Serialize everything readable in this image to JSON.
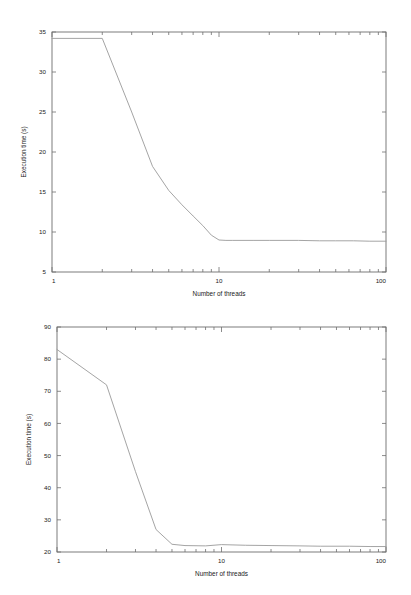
{
  "page": {
    "background_color": "#ffffff",
    "ink_color": "#1a1a1a",
    "curve_color": "#9a9a9a",
    "axis_color": "#6e6e6e"
  },
  "chart_data": [
    {
      "id": "top",
      "type": "line",
      "title": "",
      "xlabel": "Number of threads",
      "ylabel": "Execution time (s)",
      "xscale": "log",
      "yscale": "linear",
      "xlim": [
        1,
        100
      ],
      "ylim": [
        5,
        35
      ],
      "grid": false,
      "legend": null,
      "xticks": [
        1,
        10,
        100
      ],
      "xtick_labels": [
        "1",
        "10",
        "100"
      ],
      "yticks": [
        5,
        10,
        15,
        20,
        25,
        30,
        35
      ],
      "ytick_labels": [
        "5",
        "10",
        "15",
        "20",
        "25",
        "30",
        "35"
      ],
      "x": [
        1,
        2,
        3,
        4,
        5,
        6,
        7,
        8,
        9,
        10,
        11,
        12,
        16,
        20,
        30,
        40,
        50,
        64,
        80,
        100
      ],
      "y": [
        34.2,
        34.2,
        25.0,
        18.2,
        15.2,
        13.4,
        12.0,
        10.8,
        9.6,
        9.0,
        8.95,
        8.95,
        8.95,
        8.95,
        8.95,
        8.9,
        8.9,
        8.9,
        8.85,
        8.85
      ]
    },
    {
      "id": "bottom",
      "type": "line",
      "title": "",
      "xlabel": "Number of threads",
      "ylabel": "Execution time (s)",
      "xscale": "log",
      "yscale": "linear",
      "xlim": [
        1,
        100
      ],
      "ylim": [
        20,
        90
      ],
      "grid": false,
      "legend": null,
      "xticks": [
        1,
        10,
        100
      ],
      "xtick_labels": [
        "1",
        "10",
        "100"
      ],
      "yticks": [
        20,
        30,
        40,
        50,
        60,
        70,
        80,
        90
      ],
      "ytick_labels": [
        "20",
        "30",
        "40",
        "50",
        "60",
        "70",
        "80",
        "90"
      ],
      "x": [
        1,
        2,
        3,
        4,
        5,
        6,
        8,
        10,
        14,
        20,
        30,
        40,
        60,
        80,
        100
      ],
      "y": [
        83.0,
        72.0,
        45.0,
        27.0,
        22.4,
        22.0,
        21.9,
        22.3,
        22.1,
        22.0,
        21.9,
        21.8,
        21.8,
        21.7,
        21.7
      ]
    }
  ]
}
